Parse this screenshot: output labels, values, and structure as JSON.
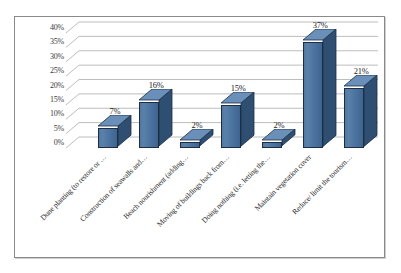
{
  "chart_data": {
    "type": "bar",
    "title": "",
    "subtitle": "",
    "xlabel": "",
    "ylabel": "",
    "ylim": [
      0,
      40
    ],
    "grid": true,
    "legend": false,
    "legend_position": "none",
    "three_d": true,
    "bar_color": "#4d74a0",
    "bar_side_color": "#2f4f72",
    "bar_top_color": "#6a8fb8",
    "bar_outline_color": "#1c2e44",
    "gridline_color": "#b5b5b5",
    "frame_color": "#8a8a8a",
    "text_color": "#2b2b2b",
    "yticks": [
      "0%",
      "5%",
      "10%",
      "15%",
      "20%",
      "25%",
      "30%",
      "35%",
      "40%"
    ],
    "ytick_values": [
      0,
      5,
      10,
      15,
      20,
      25,
      30,
      35,
      40
    ],
    "categories": [
      "Dune planting (to restore or …",
      "Construction of seawalls and…",
      "Beach nourishment (adding…",
      "Moving of buildings back from…",
      "Doing nothing (i.e. letting the…",
      "Maintain vegetation cover",
      "Reduce/ limit the tourism…"
    ],
    "values": [
      7,
      16,
      2,
      15,
      2,
      37,
      21
    ],
    "data_labels": [
      "7%",
      "16%",
      "2%",
      "15%",
      "2%",
      "37%",
      "21%"
    ]
  }
}
